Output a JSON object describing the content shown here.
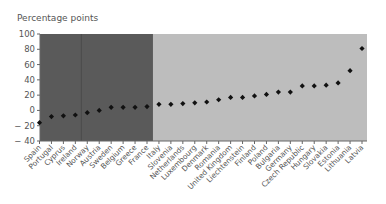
{
  "chart_data": {
    "type": "scatter",
    "title": "",
    "xlabel": "",
    "ylabel": "Percentage points",
    "ylim": [
      -40,
      100
    ],
    "yticks": [
      100,
      80,
      60,
      40,
      20,
      0,
      -20,
      -40
    ],
    "grid": false,
    "legend": null,
    "categories": [
      "Spain",
      "Portugal",
      "Cyprus",
      "Ireland",
      "Norway",
      "Austria",
      "Sweden",
      "Belgium",
      "Greece",
      "France",
      "Italy",
      "Slovenia",
      "Netherlands",
      "Luxembourg",
      "Denmark",
      "Romania",
      "United Kingdom",
      "Liechtenstein",
      "Finland",
      "Poland",
      "Bulgaria",
      "Germany",
      "Czech Republic",
      "Hungary",
      "Slovakia",
      "Estonia",
      "Lithuania",
      "Latvia"
    ],
    "values": [
      -16,
      -8,
      -7,
      -6,
      -3,
      0,
      4,
      4,
      4,
      5,
      8,
      8,
      9,
      10,
      11,
      14,
      17,
      17,
      19,
      21,
      24,
      24,
      32,
      32,
      33,
      36,
      52,
      81
    ],
    "shaded_regions": [
      {
        "from_category": "Spain",
        "to_category": "France",
        "color": "#5a5a5a"
      },
      {
        "from_category": "Italy",
        "to_category": "Latvia",
        "color": "#bdbdbd"
      }
    ],
    "separator_after_category": "Ireland",
    "marker": {
      "shape": "diamond",
      "color": "#111111"
    }
  },
  "header": {
    "ylabel": "Percentage points"
  }
}
